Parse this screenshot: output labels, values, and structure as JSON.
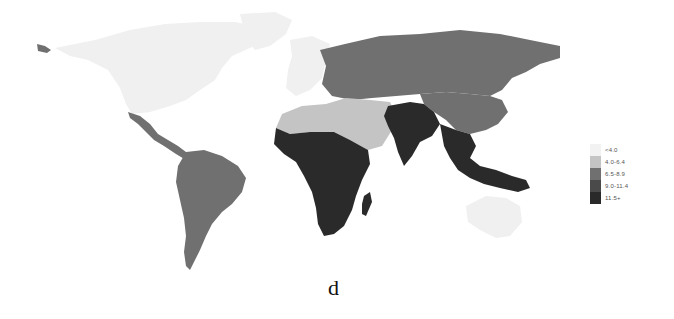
{
  "panel_label": "d",
  "legend": {
    "title": "",
    "items": [
      {
        "label": "<4.0",
        "color": "#f2f2f2"
      },
      {
        "label": "4.0-6.4",
        "color": "#c4c4c4"
      },
      {
        "label": "6.5-8.9",
        "color": "#707070"
      },
      {
        "label": "9.0-11.4",
        "color": "#4a4a4a"
      },
      {
        "label": "11.5+",
        "color": "#2a2a2a"
      }
    ]
  },
  "regions": [
    {
      "name": "North America",
      "class": "<4.0",
      "color": "#f0f0f0"
    },
    {
      "name": "Greenland",
      "class": "<4.0",
      "color": "#f0f0f0"
    },
    {
      "name": "Central America & Mexico",
      "class": "6.5-8.9",
      "color": "#707070"
    },
    {
      "name": "South America",
      "class": "6.5-8.9",
      "color": "#707070"
    },
    {
      "name": "Western Europe",
      "class": "<4.0",
      "color": "#f0f0f0"
    },
    {
      "name": "Eastern Europe & Russia",
      "class": "6.5-8.9",
      "color": "#707070"
    },
    {
      "name": "China & East Asia",
      "class": "6.5-8.9",
      "color": "#707070"
    },
    {
      "name": "North Africa & Middle East",
      "class": "4.0-6.4",
      "color": "#c4c4c4"
    },
    {
      "name": "Sub-Saharan Africa",
      "class": "11.5+",
      "color": "#2a2a2a"
    },
    {
      "name": "Madagascar",
      "class": "11.5+",
      "color": "#2a2a2a"
    },
    {
      "name": "South Asia",
      "class": "11.5+",
      "color": "#2a2a2a"
    },
    {
      "name": "Southeast Asia",
      "class": "11.5+",
      "color": "#2a2a2a"
    },
    {
      "name": "Australia",
      "class": "<4.0",
      "color": "#f0f0f0"
    },
    {
      "name": "Alaska tip / Hawaii",
      "class": "6.5-8.9",
      "color": "#707070"
    }
  ]
}
